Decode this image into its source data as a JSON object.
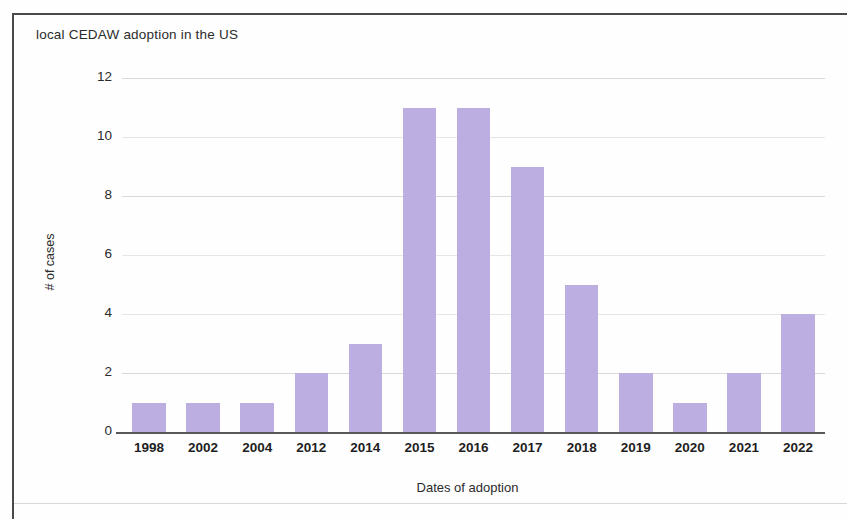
{
  "chart_data": {
    "type": "bar",
    "title": "local CEDAW adoption in the US",
    "xlabel": "Dates of adoption",
    "ylabel": "# of cases",
    "categories": [
      "1998",
      "2002",
      "2004",
      "2012",
      "2014",
      "2015",
      "2016",
      "2017",
      "2018",
      "2019",
      "2020",
      "2021",
      "2022"
    ],
    "values": [
      1,
      1,
      1,
      2,
      3,
      11,
      11,
      9,
      5,
      2,
      1,
      2,
      4
    ],
    "ylim": [
      0,
      12
    ],
    "yticks": [
      0,
      2,
      4,
      6,
      8,
      10,
      12
    ],
    "ytick_labels": [
      "0",
      "2",
      "4",
      "6",
      "8",
      "10",
      "12"
    ],
    "grid": true,
    "legend": false,
    "bar_color": "#bcaee0",
    "gridline_color": "#d9d9d9",
    "axis_color": "#585858",
    "text_color": "#2b2b2b",
    "background": "#fefefe"
  }
}
